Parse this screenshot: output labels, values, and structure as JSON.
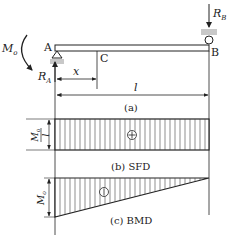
{
  "figure": {
    "beam": {
      "left_support": "A",
      "right_support": "B",
      "point": "C",
      "moment_label": "M",
      "moment_sub": "o",
      "reaction_a": "R",
      "reaction_a_sub": "A",
      "reaction_b": "R",
      "reaction_b_sub": "B",
      "dim_x": "x",
      "dim_l": "l",
      "caption": "(a)"
    },
    "sfd": {
      "value_num": "M",
      "value_num_sub": "o",
      "value_den": "l",
      "sign": "⊕",
      "caption": "(b) SFD"
    },
    "bmd": {
      "value": "M",
      "value_sub": "o",
      "sign": "⊖",
      "caption": "(c) BMD"
    }
  },
  "colors": {
    "line": "#222222",
    "support_fill": "#c8c8c8",
    "hatch": "#333333"
  }
}
